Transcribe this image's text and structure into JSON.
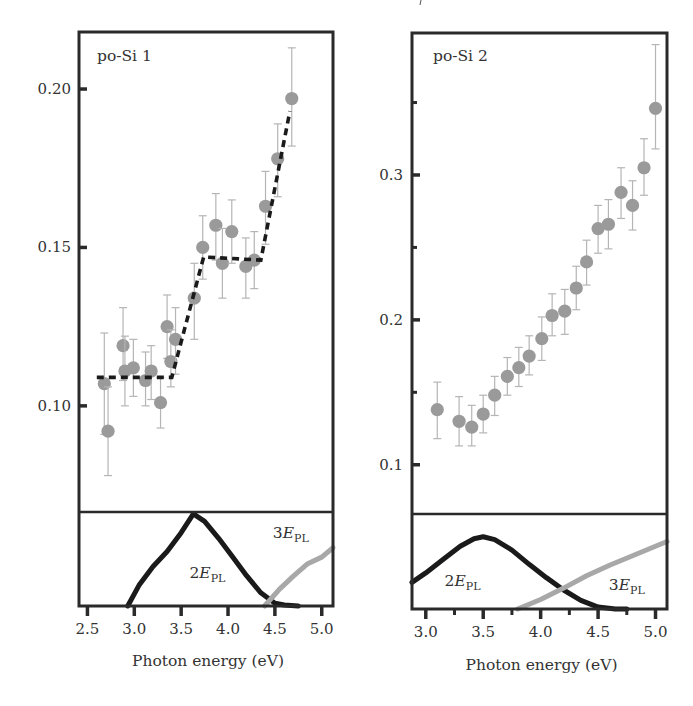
{
  "chart_data": [
    {
      "type": "scatter",
      "panel": "left",
      "title": "po-Si 1",
      "xlabel": "Photon energy (eV)",
      "ylabel": "",
      "xlim": [
        2.41,
        5.12
      ],
      "ylim_top": [
        0.0665,
        0.218
      ],
      "x_ticks": [
        2.5,
        3.0,
        3.5,
        4.0,
        4.5,
        5.0
      ],
      "x_tick_labels": [
        "2.5",
        "3.0",
        "3.5",
        "4.0",
        "4.5",
        "5.0"
      ],
      "y_ticks": [
        0.1,
        0.15,
        0.2
      ],
      "y_tick_labels": [
        "0.10",
        "0.15",
        "0.20"
      ],
      "grid": false,
      "marker_color": "#9a9a9a",
      "errorbar_color": "#b5b5b5",
      "points": [
        {
          "x": 2.68,
          "y": 0.107,
          "ylo": 0.091,
          "yhi": 0.123
        },
        {
          "x": 2.72,
          "y": 0.092,
          "ylo": 0.078,
          "yhi": 0.106
        },
        {
          "x": 2.88,
          "y": 0.119,
          "ylo": 0.108,
          "yhi": 0.131
        },
        {
          "x": 2.9,
          "y": 0.111,
          "ylo": 0.1,
          "yhi": 0.122
        },
        {
          "x": 2.99,
          "y": 0.112,
          "ylo": 0.103,
          "yhi": 0.121
        },
        {
          "x": 3.12,
          "y": 0.108,
          "ylo": 0.1,
          "yhi": 0.117
        },
        {
          "x": 3.18,
          "y": 0.111,
          "ylo": 0.102,
          "yhi": 0.119
        },
        {
          "x": 3.28,
          "y": 0.101,
          "ylo": 0.093,
          "yhi": 0.109
        },
        {
          "x": 3.35,
          "y": 0.125,
          "ylo": 0.115,
          "yhi": 0.135
        },
        {
          "x": 3.39,
          "y": 0.114,
          "ylo": 0.106,
          "yhi": 0.124
        },
        {
          "x": 3.44,
          "y": 0.121,
          "ylo": 0.11,
          "yhi": 0.131
        },
        {
          "x": 3.64,
          "y": 0.134,
          "ylo": 0.121,
          "yhi": 0.145
        },
        {
          "x": 3.73,
          "y": 0.15,
          "ylo": 0.14,
          "yhi": 0.16
        },
        {
          "x": 3.87,
          "y": 0.157,
          "ylo": 0.146,
          "yhi": 0.167
        },
        {
          "x": 3.94,
          "y": 0.145,
          "ylo": 0.134,
          "yhi": 0.156
        },
        {
          "x": 4.04,
          "y": 0.155,
          "ylo": 0.145,
          "yhi": 0.165
        },
        {
          "x": 4.19,
          "y": 0.144,
          "ylo": 0.134,
          "yhi": 0.153
        },
        {
          "x": 4.28,
          "y": 0.146,
          "ylo": 0.137,
          "yhi": 0.155
        },
        {
          "x": 4.4,
          "y": 0.163,
          "ylo": 0.151,
          "yhi": 0.174
        },
        {
          "x": 4.53,
          "y": 0.178,
          "ylo": 0.166,
          "yhi": 0.189
        },
        {
          "x": 4.68,
          "y": 0.197,
          "ylo": 0.182,
          "yhi": 0.213
        }
      ],
      "fit_line": {
        "style": "dashed",
        "color": "#1a1a1a",
        "points": [
          [
            2.6,
            0.109
          ],
          [
            3.4,
            0.109
          ],
          [
            3.74,
            0.147
          ],
          [
            4.35,
            0.146
          ],
          [
            4.66,
            0.193
          ]
        ]
      },
      "bottom_panel": {
        "curves": [
          {
            "name": "2E_PL",
            "color": "#1a1a1a",
            "x": [
              2.93,
              3.05,
              3.2,
              3.35,
              3.5,
              3.63,
              3.75,
              3.9,
              4.05,
              4.2,
              4.35,
              4.5,
              4.6,
              4.75
            ],
            "y": [
              0.0,
              0.22,
              0.42,
              0.58,
              0.78,
              0.98,
              0.9,
              0.72,
              0.52,
              0.32,
              0.14,
              0.03,
              0.01,
              0.0
            ]
          },
          {
            "name": "3E_PL",
            "color": "#a8a8a8",
            "x": [
              4.39,
              4.55,
              4.7,
              4.85,
              5.0,
              5.12
            ],
            "y": [
              0.0,
              0.18,
              0.32,
              0.45,
              0.52,
              0.62
            ]
          }
        ]
      },
      "annotations": [
        {
          "text": "2E",
          "sub": "PL",
          "x": 3.78,
          "level": 0.35
        },
        {
          "text": "3E",
          "sub": "PL",
          "x": 4.67,
          "level": 0.78
        }
      ]
    },
    {
      "type": "scatter",
      "panel": "right",
      "title": "po-Si 2",
      "xlabel": "Photon energy (eV)",
      "ylabel": "",
      "xlim": [
        2.88,
        5.1
      ],
      "ylim_top": [
        0.066,
        0.398
      ],
      "x_ticks": [
        3.0,
        3.5,
        4.0,
        4.5,
        5.0
      ],
      "x_minor_ticks": [
        3.25,
        3.75,
        4.25,
        4.75
      ],
      "x_tick_labels": [
        "3.0",
        "3.5",
        "4.0",
        "4.5",
        "5.0"
      ],
      "y_ticks": [
        0.1,
        0.2,
        0.3
      ],
      "y_minor_ticks": [
        0.15,
        0.25,
        0.35
      ],
      "y_tick_labels": [
        "0.1",
        "0.2",
        "0.3"
      ],
      "grid": false,
      "marker_color": "#9a9a9a",
      "errorbar_color": "#b5b5b5",
      "points": [
        {
          "x": 3.1,
          "y": 0.138,
          "ylo": 0.118,
          "yhi": 0.157
        },
        {
          "x": 3.29,
          "y": 0.13,
          "ylo": 0.113,
          "yhi": 0.147
        },
        {
          "x": 3.4,
          "y": 0.126,
          "ylo": 0.113,
          "yhi": 0.141
        },
        {
          "x": 3.5,
          "y": 0.135,
          "ylo": 0.122,
          "yhi": 0.148
        },
        {
          "x": 3.6,
          "y": 0.148,
          "ylo": 0.134,
          "yhi": 0.161
        },
        {
          "x": 3.71,
          "y": 0.161,
          "ylo": 0.148,
          "yhi": 0.174
        },
        {
          "x": 3.81,
          "y": 0.167,
          "ylo": 0.154,
          "yhi": 0.181
        },
        {
          "x": 3.9,
          "y": 0.175,
          "ylo": 0.162,
          "yhi": 0.189
        },
        {
          "x": 4.01,
          "y": 0.187,
          "ylo": 0.172,
          "yhi": 0.202
        },
        {
          "x": 4.1,
          "y": 0.203,
          "ylo": 0.189,
          "yhi": 0.218
        },
        {
          "x": 4.21,
          "y": 0.206,
          "ylo": 0.19,
          "yhi": 0.221
        },
        {
          "x": 4.31,
          "y": 0.222,
          "ylo": 0.207,
          "yhi": 0.237
        },
        {
          "x": 4.4,
          "y": 0.24,
          "ylo": 0.224,
          "yhi": 0.255
        },
        {
          "x": 4.5,
          "y": 0.263,
          "ylo": 0.246,
          "yhi": 0.279
        },
        {
          "x": 4.59,
          "y": 0.266,
          "ylo": 0.249,
          "yhi": 0.283
        },
        {
          "x": 4.7,
          "y": 0.288,
          "ylo": 0.27,
          "yhi": 0.305
        },
        {
          "x": 4.8,
          "y": 0.279,
          "ylo": 0.262,
          "yhi": 0.296
        },
        {
          "x": 4.9,
          "y": 0.305,
          "ylo": 0.286,
          "yhi": 0.325
        },
        {
          "x": 5.0,
          "y": 0.346,
          "ylo": 0.318,
          "yhi": 0.39
        }
      ],
      "bottom_panel": {
        "curves": [
          {
            "name": "2E_PL",
            "color": "#1a1a1a",
            "x": [
              2.88,
              3.0,
              3.15,
              3.3,
              3.42,
              3.5,
              3.6,
              3.75,
              3.9,
              4.05,
              4.2,
              4.35,
              4.5,
              4.65,
              4.75
            ],
            "y": [
              0.28,
              0.38,
              0.52,
              0.66,
              0.74,
              0.76,
              0.73,
              0.62,
              0.47,
              0.33,
              0.2,
              0.09,
              0.02,
              0.0,
              0.0
            ]
          },
          {
            "name": "3E_PL",
            "color": "#a8a8a8",
            "x": [
              3.8,
              4.0,
              4.2,
              4.4,
              4.6,
              4.8,
              5.0,
              5.1
            ],
            "y": [
              0.0,
              0.1,
              0.22,
              0.35,
              0.46,
              0.56,
              0.66,
              0.71
            ]
          }
        ]
      },
      "annotations": [
        {
          "text": "2E",
          "sub": "PL",
          "x": 3.32,
          "level": 0.3
        },
        {
          "text": "3E",
          "sub": "PL",
          "x": 4.75,
          "level": 0.25
        }
      ]
    }
  ]
}
